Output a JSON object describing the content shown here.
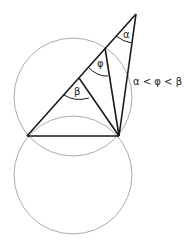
{
  "diagram": {
    "labels": {
      "alpha": "α",
      "phi": "φ",
      "beta": "β",
      "relation": "α < φ < β"
    },
    "colors": {
      "lines": "#1a1a1a",
      "circles": "#aaaaaa",
      "background": "#ffffff"
    }
  }
}
